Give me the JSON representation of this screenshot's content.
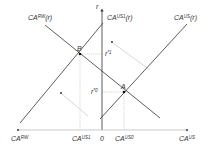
{
  "diagram": {
    "type": "economics-graph",
    "axes": {
      "vertical_label": "r",
      "horizontal_left_label": "CA",
      "horizontal_left_sup": "RW",
      "horizontal_right_label": "CA",
      "horizontal_right_sup": "US",
      "origin_label": "0"
    },
    "curves": [
      {
        "id": "ca-rw",
        "label": "CA",
        "sup": "RW",
        "arg": "(r)"
      },
      {
        "id": "ca-us1",
        "label": "CA",
        "sup": "US1",
        "arg": "(r)"
      },
      {
        "id": "ca-us",
        "label": "CA",
        "sup": "US",
        "arg": "(r)"
      }
    ],
    "points": [
      {
        "id": "B",
        "label": "B"
      },
      {
        "id": "A",
        "label": "A"
      }
    ],
    "rates": [
      {
        "id": "r1",
        "label": "r",
        "sup": "*1"
      },
      {
        "id": "r0",
        "label": "r",
        "sup": "*0"
      }
    ],
    "x_ticks": [
      {
        "id": "ca-us1-tick",
        "label": "CA",
        "sup": "US1"
      },
      {
        "id": "ca-us0-tick",
        "label": "CA",
        "sup": "US0"
      }
    ],
    "colors": {
      "line": "#333333",
      "guide": "#bbbbbb",
      "arrow": "#cccccc"
    }
  }
}
